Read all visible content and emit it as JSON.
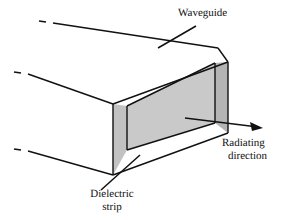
{
  "figure": {
    "background_color": "#ffffff",
    "line_color": "#111111",
    "fill_top_face": "#ffffff",
    "fill_inner_face": "#c9c9c9",
    "fill_strip_face": "#c2c2c2",
    "fill_end_wall": "#b9b9b9",
    "fill_bottom_face": "#ffffff"
  },
  "labels": {
    "waveguide": "Waveguide",
    "dielectric_line1": "Dielectric",
    "dielectric_line2": "strip",
    "radiating_line1": "Radiating",
    "radiating_line2": "direction"
  },
  "geometry": {
    "top_back_far": "20,22",
    "top_back_near": "218,48",
    "top_front_left": "113,104",
    "top_front_right": "228,62",
    "bottom_front_left": "113,175",
    "bottom_back_far": "14,150",
    "bottom_right": "228,133",
    "strip_x_left": "113",
    "strip_x_right": "127",
    "end_wall_x_left": "215",
    "end_wall_x_right": "228",
    "arrow_tail": "185,118",
    "arrow_head": "262,128"
  }
}
